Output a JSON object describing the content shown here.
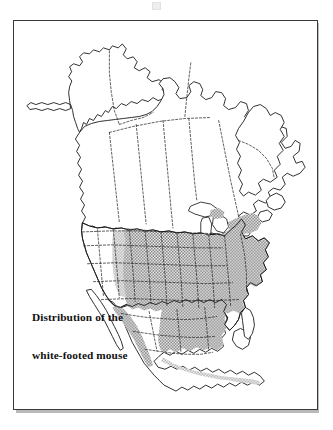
{
  "figure": {
    "caption_line1": "Distribution of the",
    "caption_line2": "white-footed mouse",
    "title": "Distribution of the white-footed mouse"
  },
  "map": {
    "region_name": "North America",
    "legend_shaded_meaning": "Range of the white-footed mouse",
    "features": [
      "Alaska",
      "Canada",
      "Greenland (partial)",
      "United States",
      "Mexico",
      "Baja California",
      "Florida",
      "Great Lakes",
      "Newfoundland",
      "Hudson Bay",
      "Gulf of Mexico"
    ]
  },
  "style": {
    "background": "#ffffff",
    "border_color": "#3a3a3a",
    "coastline_color": "#1a1a1a",
    "internal_border_color": "#2a2a2a",
    "shading_color": "#9a9a9a",
    "shading_pattern": "checkered-stipple",
    "caption_color": "#111111"
  }
}
